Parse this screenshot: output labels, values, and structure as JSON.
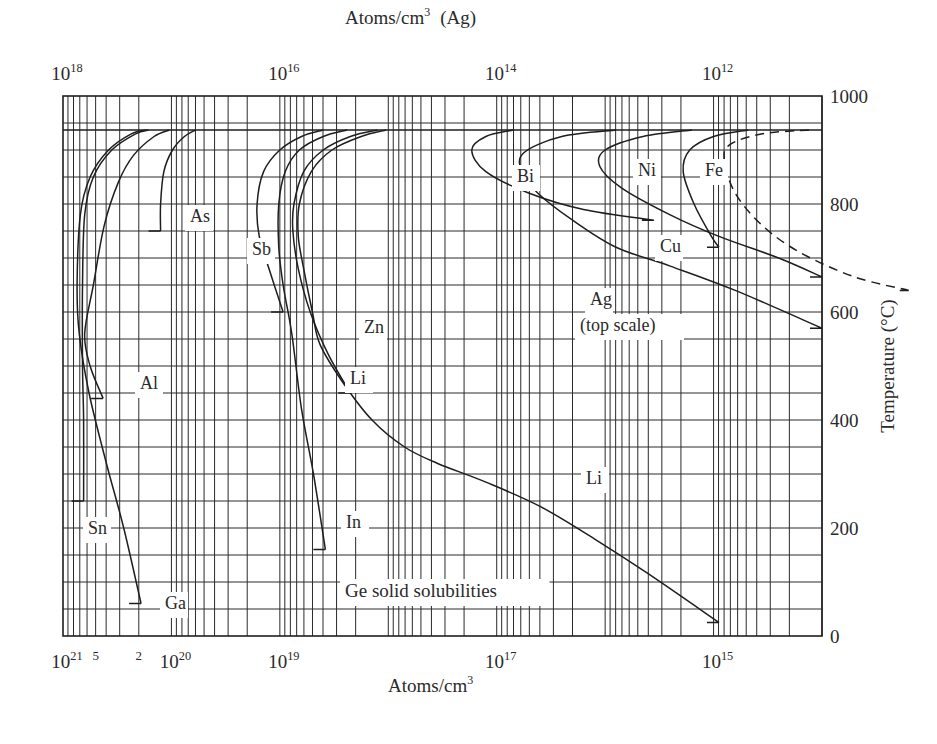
{
  "chart_data": {
    "type": "line",
    "title": "Ge solid solubilities",
    "xlabel": "Atoms/cm3",
    "xlabel_top": "Atoms/cm3 (Ag)",
    "ylabel": "Temperature (°C)",
    "xscale": "log",
    "xlim_bottom": [
      1e+21,
      100000000000000.0
    ],
    "xlim_top": [
      1e+18,
      100000000000.0
    ],
    "xaxis_reversed": true,
    "ylim": [
      0,
      1000
    ],
    "grid": true,
    "melting_point_line": 937,
    "bottom_tick_labels": [
      {
        "text": "10",
        "sup": "21",
        "log": 21
      },
      {
        "text": "5",
        "sup": "",
        "log": 20.699
      },
      {
        "text": "2",
        "sup": "",
        "log": 20.301
      },
      {
        "text": "10",
        "sup": "20",
        "log": 20
      },
      {
        "text": "10",
        "sup": "19",
        "log": 19
      },
      {
        "text": "10",
        "sup": "17",
        "log": 17
      },
      {
        "text": "10",
        "sup": "15",
        "log": 15
      }
    ],
    "top_tick_labels": [
      {
        "text": "10",
        "sup": "18",
        "log_top": 18
      },
      {
        "text": "10",
        "sup": "16",
        "log_top": 16
      },
      {
        "text": "10",
        "sup": "14",
        "log_top": 14
      },
      {
        "text": "10",
        "sup": "12",
        "log_top": 12
      }
    ],
    "y_tick_labels": [
      "0",
      "200",
      "400",
      "600",
      "800",
      "1000"
    ],
    "series": [
      {
        "name": "Sn",
        "dashed": false,
        "points": [
          [
            20.21,
            937
          ],
          [
            20.33,
            930
          ],
          [
            20.55,
            900
          ],
          [
            20.72,
            850
          ],
          [
            20.8,
            780
          ],
          [
            20.82,
            650
          ],
          [
            20.82,
            500
          ],
          [
            20.81,
            400
          ],
          [
            20.81,
            250
          ]
        ]
      },
      {
        "name": "Ga",
        "dashed": false,
        "points": [
          [
            20.23,
            937
          ],
          [
            20.37,
            930
          ],
          [
            20.58,
            900
          ],
          [
            20.75,
            850
          ],
          [
            20.84,
            780
          ],
          [
            20.87,
            650
          ],
          [
            20.85,
            560
          ],
          [
            20.76,
            450
          ],
          [
            20.6,
            320
          ],
          [
            20.44,
            200
          ],
          [
            20.28,
            60
          ]
        ]
      },
      {
        "name": "Al",
        "dashed": false,
        "points": [
          [
            20.02,
            937
          ],
          [
            20.16,
            925
          ],
          [
            20.35,
            890
          ],
          [
            20.49,
            840
          ],
          [
            20.62,
            760
          ],
          [
            20.72,
            650
          ],
          [
            20.8,
            560
          ],
          [
            20.75,
            500
          ],
          [
            20.63,
            440
          ]
        ]
      },
      {
        "name": "As",
        "dashed": false,
        "points": [
          [
            19.78,
            937
          ],
          [
            19.88,
            925
          ],
          [
            19.99,
            900
          ],
          [
            20.07,
            860
          ],
          [
            20.1,
            800
          ],
          [
            20.1,
            750
          ]
        ]
      },
      {
        "name": "Sb",
        "dashed": false,
        "points": [
          [
            18.6,
            937
          ],
          [
            18.8,
            925
          ],
          [
            19.0,
            900
          ],
          [
            19.15,
            860
          ],
          [
            19.21,
            800
          ],
          [
            19.19,
            740
          ],
          [
            19.1,
            680
          ],
          [
            18.97,
            600
          ]
        ]
      },
      {
        "name": "In",
        "dashed": false,
        "points": [
          [
            18.38,
            937
          ],
          [
            18.6,
            925
          ],
          [
            18.82,
            900
          ],
          [
            18.95,
            860
          ],
          [
            19.01,
            800
          ],
          [
            19.01,
            720
          ],
          [
            18.97,
            650
          ],
          [
            18.89,
            560
          ],
          [
            18.8,
            420
          ],
          [
            18.69,
            300
          ],
          [
            18.58,
            160
          ]
        ]
      },
      {
        "name": "Zn",
        "dashed": false,
        "points": [
          [
            18.1,
            937
          ],
          [
            18.35,
            925
          ],
          [
            18.6,
            900
          ],
          [
            18.78,
            860
          ],
          [
            18.87,
            800
          ],
          [
            18.88,
            750
          ],
          [
            18.83,
            680
          ],
          [
            18.72,
            600
          ],
          [
            18.55,
            520
          ],
          [
            18.35,
            450
          ]
        ]
      },
      {
        "name": "Li",
        "dashed": false,
        "points": [
          [
            18.02,
            937
          ],
          [
            18.25,
            925
          ],
          [
            18.52,
            900
          ],
          [
            18.71,
            860
          ],
          [
            18.82,
            800
          ],
          [
            18.83,
            740
          ],
          [
            18.78,
            680
          ],
          [
            18.7,
            600
          ],
          [
            18.63,
            540
          ],
          [
            18.42,
            470
          ],
          [
            18.15,
            400
          ],
          [
            17.85,
            350
          ],
          [
            17.55,
            320
          ],
          [
            17.1,
            285
          ],
          [
            16.6,
            240
          ],
          [
            16.1,
            180
          ],
          [
            15.6,
            115
          ],
          [
            14.95,
            25
          ]
        ]
      },
      {
        "name": "Ag (top scale)",
        "dashed": true,
        "points": [
          [
            14.12,
            937
          ],
          [
            14.55,
            930
          ],
          [
            14.85,
            910
          ],
          [
            14.9,
            880
          ],
          [
            14.8,
            820
          ],
          [
            14.55,
            760
          ],
          [
            14.2,
            710
          ],
          [
            13.7,
            665
          ],
          [
            13.2,
            640
          ]
        ]
      },
      {
        "name": "Bi",
        "dashed": false,
        "points": [
          [
            16.85,
            937
          ],
          [
            17.1,
            925
          ],
          [
            17.23,
            900
          ],
          [
            17.1,
            860
          ],
          [
            16.7,
            820
          ],
          [
            16.2,
            790
          ],
          [
            15.55,
            770
          ]
        ]
      },
      {
        "name": "Cu",
        "dashed": false,
        "points": [
          [
            15.9,
            937
          ],
          [
            16.4,
            925
          ],
          [
            16.75,
            895
          ],
          [
            16.77,
            860
          ],
          [
            16.62,
            820
          ],
          [
            16.3,
            770
          ],
          [
            15.9,
            720
          ],
          [
            15.4,
            685
          ],
          [
            14.8,
            640
          ],
          [
            14.0,
            570
          ]
        ]
      },
      {
        "name": "Ni",
        "dashed": false,
        "points": [
          [
            15.2,
            937
          ],
          [
            15.65,
            925
          ],
          [
            16.0,
            900
          ],
          [
            16.05,
            870
          ],
          [
            15.85,
            830
          ],
          [
            15.4,
            780
          ],
          [
            14.95,
            740
          ],
          [
            14.4,
            700
          ],
          [
            14.0,
            665
          ]
        ]
      },
      {
        "name": "Fe",
        "dashed": false,
        "points": [
          [
            14.68,
            937
          ],
          [
            15.0,
            925
          ],
          [
            15.22,
            900
          ],
          [
            15.28,
            860
          ],
          [
            15.18,
            800
          ],
          [
            15.02,
            740
          ],
          [
            14.95,
            720
          ]
        ]
      }
    ],
    "annotations": [
      {
        "text": "As",
        "x": 190,
        "y": 222
      },
      {
        "text": "Sb",
        "x": 252,
        "y": 255
      },
      {
        "text": "Zn",
        "x": 364,
        "y": 333
      },
      {
        "text": "Li",
        "x": 350,
        "y": 384
      },
      {
        "text": "Al",
        "x": 140,
        "y": 389
      },
      {
        "text": "Sn",
        "x": 88,
        "y": 534
      },
      {
        "text": "In",
        "x": 346,
        "y": 528
      },
      {
        "text": "Ga",
        "x": 165,
        "y": 609
      },
      {
        "text": "Li",
        "x": 586,
        "y": 484
      },
      {
        "text": "Bi",
        "x": 517,
        "y": 182
      },
      {
        "text": "Ni",
        "x": 638,
        "y": 176
      },
      {
        "text": "Fe",
        "x": 705,
        "y": 176
      },
      {
        "text": "Cu",
        "x": 660,
        "y": 252
      },
      {
        "text": "Ag",
        "x": 590,
        "y": 305
      },
      {
        "text": "(top scale)",
        "x": 580,
        "y": 331
      },
      {
        "text": "Ge solid solubilities",
        "x": 345,
        "y": 597
      }
    ]
  },
  "axes": {
    "top_title": "Atoms/cm",
    "top_title_sup": "3",
    "top_title_suffix": "(Ag)",
    "bottom_title": "Atoms/cm",
    "bottom_title_sup": "3",
    "right_title": "Temperature (°C)"
  }
}
